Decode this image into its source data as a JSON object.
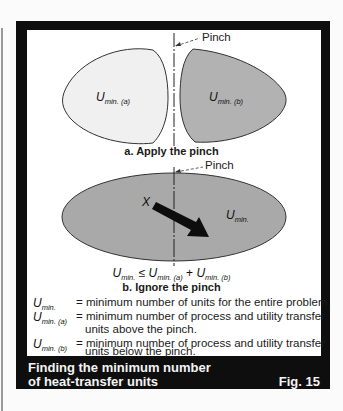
{
  "figure": {
    "number": "Fig. 15",
    "caption_line1": "Finding the minimum number",
    "caption_line2": "of heat-transfer units"
  },
  "panel_a": {
    "pinch_label": "Pinch",
    "left_region": {
      "symbol": "U",
      "sub": "min. (a)",
      "fill": "#f0f0f0"
    },
    "right_region": {
      "symbol": "U",
      "sub": "min. (b)",
      "fill": "#b2b2b2"
    },
    "subcaption": "a. Apply the pinch"
  },
  "panel_b": {
    "pinch_label": "Pinch",
    "region": {
      "symbol": "U",
      "sub": "min.",
      "fill": "#a9a9a9"
    },
    "arrow_label": "X",
    "equation": {
      "lhs_symbol": "U",
      "lhs_sub": "min.",
      "relation": "≤",
      "t1_symbol": "U",
      "t1_sub": "min. (a)",
      "plus": "+",
      "t2_symbol": "U",
      "t2_sub": "min. (b)"
    },
    "subcaption": "b. Ignore the pinch"
  },
  "legend": [
    {
      "symbol": "U",
      "sub": "min.",
      "def_line1": "= minimum number of units for the entire problem.",
      "def_line2": ""
    },
    {
      "symbol": "U",
      "sub": "min. (a)",
      "def_line1": "= minimum number of process and utility transfer",
      "def_line2": "units above the pinch."
    },
    {
      "symbol": "U",
      "sub": "min. (b)",
      "def_line1": "= minimum number of process and utility transfer",
      "def_line2": "units below the pinch."
    }
  ],
  "colors": {
    "frame": "#0e0e0e",
    "panel": "#ffffff",
    "caption_text": "#f4f4f4"
  }
}
